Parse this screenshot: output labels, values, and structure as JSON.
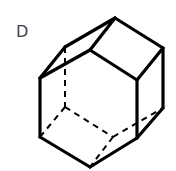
{
  "figure": {
    "label": "D",
    "colors": {
      "stroke": "#000000",
      "label": "#444444",
      "background": "#ffffff"
    },
    "vertices": {
      "top_apex": [
        115,
        18
      ],
      "right_top": [
        163,
        48
      ],
      "right_bottom": [
        163,
        108
      ],
      "front_right_top": [
        137,
        80
      ],
      "front_right_bottom": [
        137,
        138
      ],
      "bottom_apex": [
        90,
        167
      ],
      "left_bottom": [
        40,
        137
      ],
      "left_top": [
        40,
        78
      ],
      "inner_top": [
        90,
        50
      ],
      "back_upper_left": [
        65,
        47
      ],
      "hidden_back": [
        65,
        107
      ],
      "hidden_bottom": [
        113,
        137
      ]
    },
    "solid_edges": [
      [
        "top_apex",
        "right_top"
      ],
      [
        "right_top",
        "right_bottom"
      ],
      [
        "right_bottom",
        "front_right_bottom"
      ],
      [
        "front_right_bottom",
        "bottom_apex"
      ],
      [
        "bottom_apex",
        "left_bottom"
      ],
      [
        "left_bottom",
        "left_top"
      ],
      [
        "left_top",
        "back_upper_left"
      ],
      [
        "back_upper_left",
        "top_apex"
      ],
      [
        "top_apex",
        "inner_top"
      ],
      [
        "inner_top",
        "left_top"
      ],
      [
        "inner_top",
        "front_right_top"
      ],
      [
        "front_right_top",
        "right_top"
      ],
      [
        "front_right_top",
        "front_right_bottom"
      ]
    ],
    "dashed_edges": [
      [
        "back_upper_left",
        "hidden_back"
      ],
      [
        "hidden_back",
        "left_bottom"
      ],
      [
        "hidden_back",
        "hidden_bottom"
      ],
      [
        "hidden_bottom",
        "right_bottom"
      ],
      [
        "hidden_bottom",
        "bottom_apex"
      ]
    ]
  }
}
